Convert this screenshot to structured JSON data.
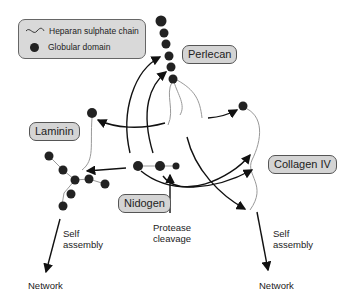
{
  "legend": {
    "items": [
      {
        "icon": "wavy-line",
        "label": "Heparan sulphate chain"
      },
      {
        "icon": "filled-circle",
        "label": "Globular domain"
      }
    ]
  },
  "labels": {
    "perlecan": "Perlecan",
    "laminin": "Laminin",
    "nidogen": "Nidogen",
    "collagen": "Collagen IV"
  },
  "annotations": {
    "protease_1": "Protease",
    "protease_2": "cleavage",
    "self_left_1": "Self",
    "self_left_2": "assembly",
    "network_left": "Network",
    "self_right_1": "Self",
    "self_right_2": "assembly",
    "network_right": "Network"
  },
  "colors": {
    "box": "#d4d4d4",
    "dot": "#222222",
    "chain": "#999999",
    "arrow": "#111111"
  }
}
